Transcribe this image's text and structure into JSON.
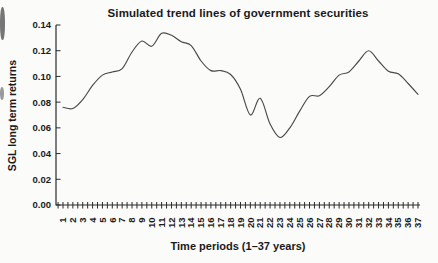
{
  "figure": {
    "title": "Simulated trend lines of government securities",
    "x_axis": {
      "label": "Time periods (1–37 years)"
    },
    "y_axis": {
      "label": "SGL long term returns"
    }
  },
  "chart_data": {
    "type": "line",
    "title": "Simulated trend lines of government securities",
    "xlabel": "Time periods (1–37 years)",
    "ylabel": "SGL long term returns",
    "x": [
      1,
      2,
      3,
      4,
      5,
      6,
      7,
      8,
      9,
      10,
      11,
      12,
      13,
      14,
      15,
      16,
      17,
      18,
      19,
      20,
      21,
      22,
      23,
      24,
      25,
      26,
      27,
      28,
      29,
      30,
      31,
      32,
      33,
      34,
      35,
      36,
      37
    ],
    "values": [
      0.076,
      0.075,
      0.082,
      0.093,
      0.101,
      0.1035,
      0.106,
      0.119,
      0.1275,
      0.1235,
      0.1335,
      0.132,
      0.127,
      0.124,
      0.112,
      0.1045,
      0.1045,
      0.1015,
      0.09,
      0.07,
      0.083,
      0.063,
      0.0525,
      0.06,
      0.073,
      0.0845,
      0.085,
      0.092,
      0.101,
      0.1035,
      0.112,
      0.12,
      0.112,
      0.104,
      0.102,
      0.0945,
      0.086
    ],
    "x_tick_labels": [
      "1",
      "2",
      "3",
      "4",
      "5",
      "6",
      "7",
      "8",
      "9",
      "10",
      "11",
      "12",
      "13",
      "14",
      "15",
      "16",
      "17",
      "18",
      "19",
      "20",
      "21",
      "22",
      "23",
      "24",
      "25",
      "26",
      "27",
      "28",
      "29",
      "30",
      "31",
      "32",
      "33",
      "34",
      "35",
      "36",
      "37"
    ],
    "y_tick_labels": [
      "0.00",
      "0.02",
      "0.04",
      "0.06",
      "0.08",
      "0.10",
      "0.12",
      "0.14"
    ],
    "xlim": [
      1,
      37
    ],
    "ylim": [
      0,
      0.14
    ],
    "ytick_step": 0.02,
    "grid": false,
    "legend": "none",
    "marker": "none",
    "line_color": "#4a4a4a",
    "axis_color": "#2b2b2b"
  }
}
